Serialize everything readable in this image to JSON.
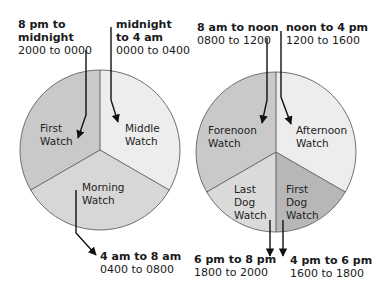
{
  "diagram": {
    "left_pie": {
      "slices": [
        {
          "name": "First Watch",
          "label_lines": [
            "First",
            "Watch"
          ],
          "time": "8 pm to midnight",
          "time_lines": [
            "8 pm to",
            "midnight"
          ],
          "hours": "2000 to 0000",
          "color": "#c9c9c9"
        },
        {
          "name": "Middle Watch",
          "label_lines": [
            "Middle",
            "Watch"
          ],
          "time": "midnight to 4 am",
          "time_lines": [
            "midnight",
            "to 4 am"
          ],
          "hours": "0000 to 0400",
          "color": "#ededed"
        },
        {
          "name": "Morning Watch",
          "label_lines": [
            "Morning",
            "Watch"
          ],
          "time": "4 am to 8 am",
          "time_lines": [
            "4 am to 8 am"
          ],
          "hours": "0400 to 0800",
          "color": "#d7d7d7"
        }
      ]
    },
    "right_pie": {
      "slices": [
        {
          "name": "Forenoon Watch",
          "label_lines": [
            "Forenoon",
            "Watch"
          ],
          "time": "8 am to noon",
          "time_lines": [
            "8 am to noon"
          ],
          "hours": "0800 to 1200",
          "color": "#c9c9c9"
        },
        {
          "name": "Afternoon Watch",
          "label_lines": [
            "Afternoon",
            "Watch"
          ],
          "time": "noon to 4 pm",
          "time_lines": [
            "noon to 4 pm"
          ],
          "hours": "1200 to 1600",
          "color": "#ededed"
        },
        {
          "name": "Last Dog Watch",
          "label_lines": [
            "Last",
            "Dog",
            "Watch"
          ],
          "time": "6 pm to 8 pm",
          "time_lines": [
            "6 pm to 8 pm"
          ],
          "hours": "1800 to 2000",
          "color": "#dadada"
        },
        {
          "name": "First Dog Watch",
          "label_lines": [
            "First",
            "Dog",
            "Watch"
          ],
          "time": "4 pm to 6 pm",
          "time_lines": [
            "4 pm to 6 pm"
          ],
          "hours": "1600 to 1800",
          "color": "#b7b7b7"
        }
      ]
    },
    "colors": {
      "outline": "#6e6e6e",
      "arrow": "#111111",
      "text": "#1a1a1a"
    }
  }
}
